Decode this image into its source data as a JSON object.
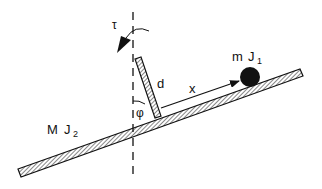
{
  "diagram": {
    "type": "mechanical-schematic",
    "labels": {
      "torque": "τ",
      "arm_length": "d",
      "ball_position": "x",
      "angle": "φ",
      "ball_mass": "m",
      "ball_inertia": "J",
      "ball_inertia_sub": "1",
      "beam_mass": "M",
      "beam_inertia": "J",
      "beam_inertia_sub": "2"
    },
    "colors": {
      "stroke": "#111111",
      "background": "#ffffff"
    }
  }
}
